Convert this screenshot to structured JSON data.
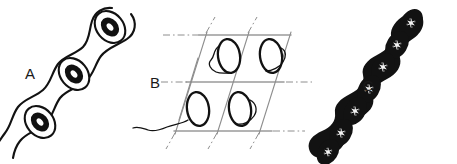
{
  "figure": {
    "background_color": "#ffffff",
    "width": 457,
    "height": 164,
    "ink_color": "#111111",
    "grid_color": "#9a9a9a",
    "highlight_color": "#ffffff"
  },
  "panels": [
    {
      "id": "A",
      "label": "A",
      "label_x": 30,
      "label_y": 79,
      "description": "chain of three outlined cells arranged along a diagonal, each with a thick dark ring-shaped nucleus",
      "cell_count": 3,
      "nucleus_count": 3,
      "orientation_degrees": -52,
      "cells": [
        {
          "cx": 110,
          "cy": 27,
          "rx": 13,
          "ry": 17,
          "nucleus_rx": 7.5,
          "nucleus_ry": 10
        },
        {
          "cx": 74,
          "cy": 74,
          "rx": 13,
          "ry": 17,
          "nucleus_rx": 7.5,
          "nucleus_ry": 10
        },
        {
          "cx": 40,
          "cy": 122,
          "rx": 13,
          "ry": 17,
          "nucleus_rx": 7.5,
          "nucleus_ry": 10
        }
      ]
    },
    {
      "id": "B",
      "label": "B",
      "label_x": 155,
      "label_y": 88,
      "description": "parallelogram lattice with dash-dot axis extensions enclosing four outlined elliptical cells with trailing flagellum-like squiggles",
      "lattice_rows": 2,
      "lattice_columns": 2,
      "cell_count": 4,
      "grid_color": "#9a9a9a",
      "cells": [
        {
          "cx": 229,
          "cy": 56,
          "rx": 11,
          "ry": 17,
          "tilt_degrees": -8,
          "has_tail": true
        },
        {
          "cx": 271,
          "cy": 56,
          "rx": 11,
          "ry": 17,
          "tilt_degrees": -8,
          "has_tail": true
        },
        {
          "cx": 198,
          "cy": 109,
          "rx": 11,
          "ry": 17,
          "tilt_degrees": -8,
          "has_tail": true
        },
        {
          "cx": 240,
          "cy": 109,
          "rx": 11,
          "ry": 17,
          "tilt_degrees": -8,
          "has_tail": true
        }
      ]
    },
    {
      "id": "C",
      "label": "C",
      "label_x": 368,
      "label_y": 91,
      "description": "dense dark beaded filament of seven solid ellipses, each containing a small white star-shaped inclusion",
      "bead_count": 7,
      "orientation_degrees": -58,
      "bead_fill": "#121212",
      "inclusion_color": "#f2f2f2",
      "beads": [
        {
          "cx": 411,
          "cy": 23
        },
        {
          "cx": 397,
          "cy": 45
        },
        {
          "cx": 383,
          "cy": 67
        },
        {
          "cx": 369,
          "cy": 89
        },
        {
          "cx": 355,
          "cy": 111
        },
        {
          "cx": 341,
          "cy": 133
        },
        {
          "cx": 327,
          "cy": 152
        }
      ]
    }
  ]
}
